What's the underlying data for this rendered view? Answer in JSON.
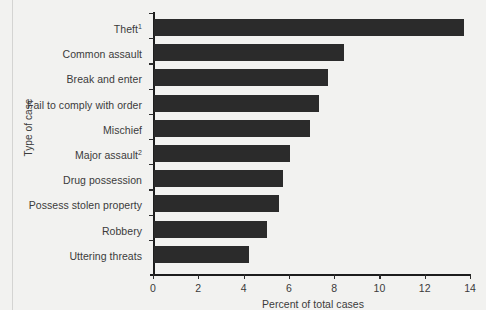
{
  "chart_data": {
    "type": "bar",
    "orientation": "horizontal",
    "title": "",
    "xlabel": "Percent of total cases",
    "ylabel": "Type of case",
    "xlim": [
      0,
      14
    ],
    "xticks": [
      "0",
      "2",
      "4",
      "6",
      "8",
      "10",
      "12",
      "14"
    ],
    "grid": false,
    "legend": null,
    "categories": [
      "Theft",
      "Common assault",
      "Break and enter",
      "Fail to comply with order",
      "Mischief",
      "Major assault",
      "Drug possession",
      "Possess stolen property",
      "Robbery",
      "Uttering threats"
    ],
    "category_footnotes": [
      "1",
      "",
      "",
      "",
      "",
      "2",
      "",
      "",
      "",
      ""
    ],
    "values": [
      13.7,
      8.4,
      7.7,
      7.3,
      6.9,
      6.0,
      5.7,
      5.5,
      5.0,
      4.2
    ],
    "bar_color": "#2b2b2b",
    "background_color": "#f2f2f0",
    "axis_color": "#1d1d1d",
    "text_color": "#3b3b3b"
  }
}
